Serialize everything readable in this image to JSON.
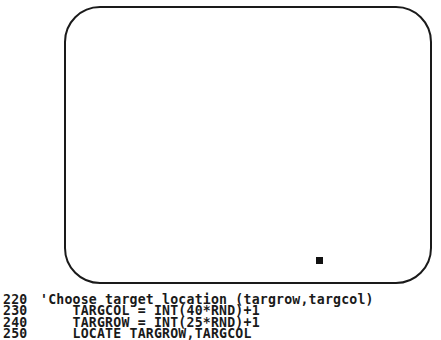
{
  "screen": {
    "frame_color": "#1a1a1a",
    "marker_color": "#111111",
    "target_marker": {
      "label": "target"
    }
  },
  "code_listing": {
    "lines": [
      {
        "number": "220",
        "code": "'Choose target location (targrow,targcol)"
      },
      {
        "number": "230",
        "code": "    TARGCOL = INT(40*RND)+1"
      },
      {
        "number": "240",
        "code": "    TARGROW = INT(25*RND)+1"
      },
      {
        "number": "250",
        "code": "    LOCATE TARGROW,TARGCOL"
      }
    ]
  }
}
